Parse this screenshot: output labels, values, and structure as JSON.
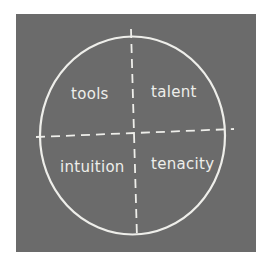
{
  "diagram": {
    "type": "quadrant-circle",
    "colors": {
      "background": "#6b6b6b",
      "chalk": "#eeeeea",
      "page": "#ffffff"
    },
    "quadrants": [
      {
        "position": "top-left",
        "label": "tools"
      },
      {
        "position": "top-right",
        "label": "talent"
      },
      {
        "position": "bottom-left",
        "label": "intuition"
      },
      {
        "position": "bottom-right",
        "label": "tenacity"
      }
    ]
  }
}
